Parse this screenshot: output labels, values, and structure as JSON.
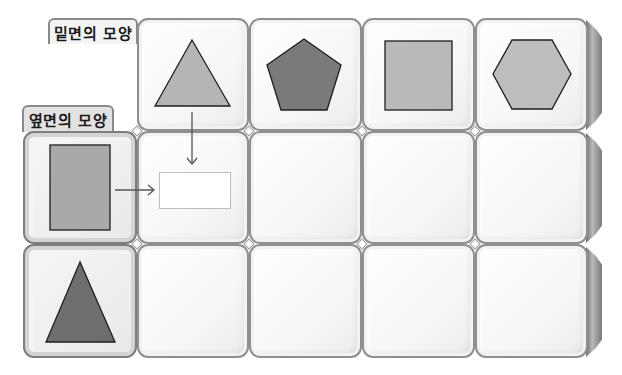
{
  "labels": {
    "base_shape": "밑면의 모양",
    "side_shape": "옆면의 모양"
  },
  "columns": [
    {
      "shape": "triangle",
      "fill": "#b5b5b5"
    },
    {
      "shape": "pentagon",
      "fill": "#7a7a7a"
    },
    {
      "shape": "square",
      "fill": "#b9b9b9"
    },
    {
      "shape": "hexagon",
      "fill": "#bdbdbd"
    }
  ],
  "rows": [
    {
      "shape": "rectangle",
      "fill": "#a9a9a9"
    },
    {
      "shape": "triangle",
      "fill": "#6e6e6e"
    }
  ],
  "example": {
    "row": 0,
    "col": 0,
    "answer_box": "",
    "arrows": [
      "down-arrow",
      "right-arrow"
    ]
  },
  "colors": {
    "stroke": "#1e1e1e",
    "tile_border": "#8f8f8f",
    "arrow": "#555555"
  }
}
